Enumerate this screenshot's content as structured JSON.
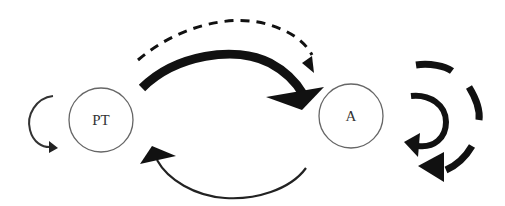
{
  "diagram": {
    "nodes": [
      {
        "id": "pt",
        "label": "PT",
        "cx": 101,
        "cy": 120,
        "r": 32
      },
      {
        "id": "a",
        "label": "A",
        "cx": 351,
        "cy": 116,
        "r": 32
      }
    ],
    "edges": [
      {
        "from": "pt",
        "to": "pt",
        "style": "thin-solid",
        "kind": "self-loop"
      },
      {
        "from": "pt",
        "to": "a",
        "style": "thick-solid",
        "kind": "arc-over"
      },
      {
        "from": "pt",
        "to": "a",
        "style": "dashed",
        "kind": "arc-over"
      },
      {
        "from": "a",
        "to": "pt",
        "style": "thin-solid",
        "kind": "arc-under"
      },
      {
        "from": "a",
        "to": "a",
        "style": "thick-solid",
        "kind": "self-loop-inner"
      },
      {
        "from": "a",
        "to": "a",
        "style": "thick-dashed",
        "kind": "self-loop-outer"
      }
    ],
    "colors": {
      "stroke": "#111111",
      "node_stroke": "#666666",
      "label": "#333333",
      "background": "#ffffff"
    }
  }
}
